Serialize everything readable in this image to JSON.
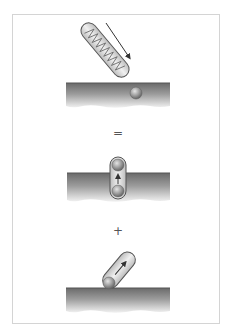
{
  "figure": {
    "panels": [
      {
        "id": "panel-1",
        "description": "Helical spring-like capsule approaching surface with ball, diagonal arrow"
      },
      {
        "id": "panel-2",
        "description": "Vertical capsule spanning surface with two balls and upward arrow"
      },
      {
        "id": "panel-3",
        "description": "Tilted capsule resting on surface with ball and arrow"
      }
    ],
    "operators": {
      "equals": "=",
      "plus": "+"
    },
    "colors": {
      "surface_top": "#6f6f6f",
      "surface_bottom": "#e8e8e8",
      "ball": "#9a9a9a",
      "capsule_fill": "#e6e6e6",
      "outline": "#555555",
      "frame": "#d4d4d4"
    }
  }
}
